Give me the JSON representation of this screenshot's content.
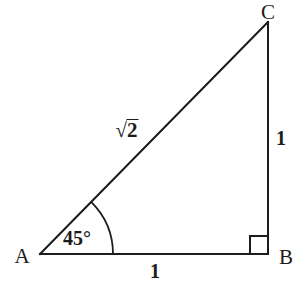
{
  "figure": {
    "type": "geometry-diagram",
    "shape": "right-triangle",
    "background_color": "#ffffff",
    "stroke_color": "#1c1c1c",
    "stroke_width": 2
  },
  "vertices": {
    "a": {
      "label": "A",
      "x": 40,
      "y": 254,
      "label_x": 22,
      "label_y": 256
    },
    "b": {
      "label": "B",
      "x": 268,
      "y": 254,
      "label_x": 286,
      "label_y": 257
    },
    "c": {
      "label": "C",
      "x": 268,
      "y": 22,
      "label_x": 268,
      "label_y": 12
    }
  },
  "sides": {
    "base": {
      "label": "1",
      "label_x": 155,
      "label_y": 271,
      "from": "A",
      "to": "B"
    },
    "vertical": {
      "label": "1",
      "label_x": 281,
      "label_y": 138,
      "from": "B",
      "to": "C"
    },
    "hypotenuse": {
      "radical_sign": "√",
      "radicand": "2",
      "label_x": 127,
      "label_y": 130,
      "from": "A",
      "to": "C"
    }
  },
  "angles": {
    "at_a": {
      "label": "45°",
      "label_x": 77,
      "label_y": 238,
      "arc_radius": 73,
      "arc_start_x": 113,
      "arc_start_y": 254,
      "arc_end_x": 88.4,
      "arc_end_y": 202.4
    },
    "at_b": {
      "label": "right-angle",
      "marker_size": 18,
      "marker_x": 250,
      "marker_y": 236
    }
  }
}
